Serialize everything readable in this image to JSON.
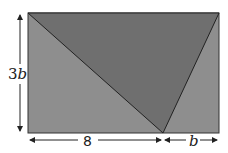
{
  "diagram": {
    "title": "",
    "shapes": {
      "rectangle": {
        "fill": "#8e8e8e",
        "stroke": "#333333"
      },
      "inner_triangle": {
        "fill": "#6f6f6f",
        "stroke": "#222222"
      }
    },
    "labels": {
      "height": "3b",
      "height_coef": "3",
      "height_var": "b",
      "base_left": "8",
      "base_right": "b"
    }
  }
}
